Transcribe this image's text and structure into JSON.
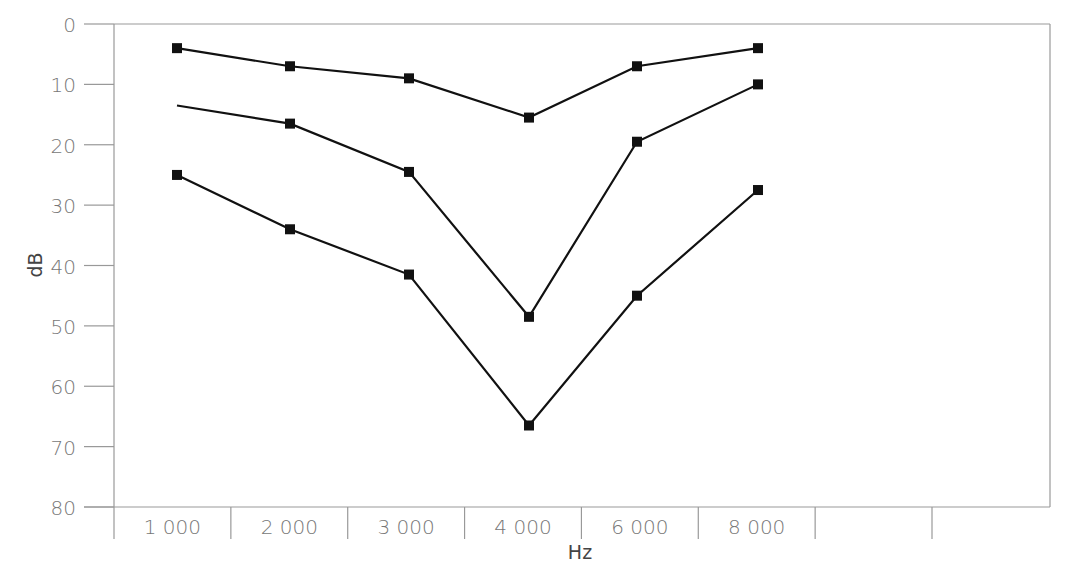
{
  "chart_data": {
    "type": "line",
    "title": "",
    "xlabel": "Hz",
    "ylabel": "dB",
    "categories": [
      "1 000",
      "2 000",
      "3 000",
      "4 000",
      "6 000",
      "8 000"
    ],
    "extra_empty_category_slots": 2,
    "y_ticks": [
      0,
      10,
      20,
      30,
      40,
      50,
      60,
      70,
      80
    ],
    "ylim": [
      0,
      80
    ],
    "y_inverted": true,
    "grid": false,
    "legend": null,
    "marker": "square",
    "series": [
      {
        "name": "curve-1",
        "values": [
          4,
          7,
          9,
          15.5,
          7,
          4
        ],
        "markers": [
          true,
          true,
          true,
          true,
          true,
          true
        ]
      },
      {
        "name": "curve-2",
        "values": [
          13.5,
          16.5,
          24.5,
          48.5,
          19.5,
          10
        ],
        "markers": [
          false,
          true,
          true,
          true,
          true,
          true
        ]
      },
      {
        "name": "curve-3",
        "values": [
          25,
          34,
          41.5,
          66.5,
          45,
          27.5
        ],
        "markers": [
          true,
          true,
          true,
          true,
          true,
          true
        ]
      }
    ],
    "colors": {
      "line": "#111111",
      "axis": "#999999",
      "label": "#777777"
    }
  }
}
